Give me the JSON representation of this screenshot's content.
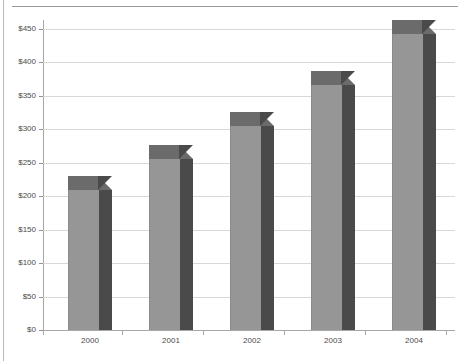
{
  "chart_data": {
    "type": "bar",
    "title": "",
    "subtitle": "",
    "xlabel": "",
    "ylabel": "",
    "categories": [
      "2000",
      "2001",
      "2002",
      "2003",
      "2004"
    ],
    "values": [
      210,
      255,
      305,
      367,
      443
    ],
    "series": [
      {
        "name": "",
        "values": [
          210,
          255,
          305,
          367,
          443
        ]
      }
    ],
    "ylim": [
      0,
      450
    ],
    "ytick_values": [
      0,
      50,
      100,
      150,
      200,
      250,
      300,
      350,
      400,
      450
    ],
    "ytick_labels": [
      "$0",
      "$50",
      "$100",
      "$150",
      "$200",
      "$250",
      "$300",
      "$350",
      "$400",
      "$450"
    ],
    "grid": true,
    "grid_axis": "y",
    "legend": false,
    "legend_position": "none",
    "style": "3d-column",
    "annotations": []
  },
  "colors": {
    "bar_front": "#969696",
    "bar_top": "#6b6b6b",
    "bar_side": "#4a4a4a",
    "gridline": "#d8d8d8",
    "axis": "#a8a8a8",
    "text": "#4a4a4a",
    "background": "#ffffff"
  }
}
